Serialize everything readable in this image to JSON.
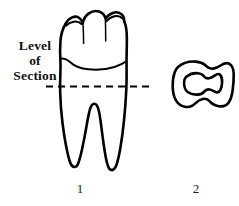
{
  "figure": {
    "background_color": "#ffffff",
    "ink_color": "#000000",
    "annotation": {
      "label_lines": [
        "Level",
        "of",
        "Section"
      ],
      "line_1": "Level",
      "line_2": "of",
      "line_3": "Section",
      "leader": {
        "style": "dashed",
        "name": "level-of-section-dashed-line"
      }
    },
    "panels": [
      {
        "number": "1",
        "name": "tooth-longitudinal",
        "description": "multi-cusped crown with cervical line and two divergent roots"
      },
      {
        "number": "2",
        "name": "root-cross-section",
        "description": "rounded peanut-shaped outline with hourglass pulp canal"
      }
    ],
    "caption_numbers": {
      "left": "1",
      "right": "2"
    }
  }
}
